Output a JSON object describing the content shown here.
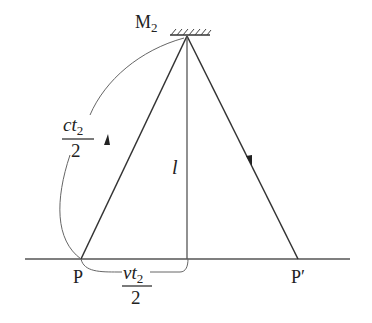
{
  "diagram": {
    "type": "light-clock-path",
    "labels": {
      "mirror": "M",
      "mirror_sub": "2",
      "point_start": "P",
      "point_end": "P′",
      "height": "l",
      "hyp_num_c": "c",
      "hyp_num_t": "t",
      "hyp_num_sub": "2",
      "hyp_den": "2",
      "base_num_v": "v",
      "base_num_t": "t",
      "base_num_sub": "2",
      "base_den": "2"
    },
    "colors": {
      "line": "#333333",
      "brace": "#555555",
      "background": "#ffffff"
    }
  }
}
